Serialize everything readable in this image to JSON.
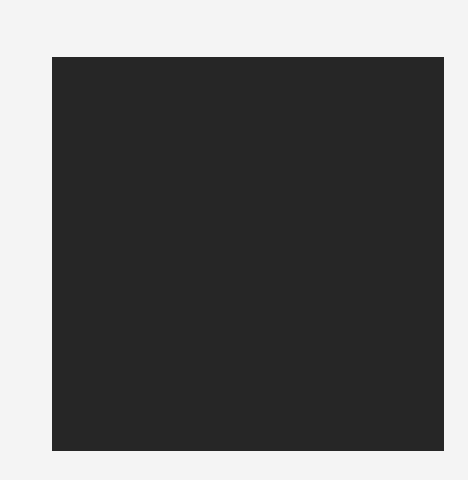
{
  "chart_data": {
    "type": "heatmap",
    "title": "",
    "xlabel": "",
    "ylabel": "",
    "colormap": "gray",
    "vmin": 0,
    "vmax": 16,
    "x_ticks": [
      "0",
      "1",
      "2",
      "3",
      "4",
      "5",
      "6",
      "7"
    ],
    "y_ticks": [
      "0",
      "1",
      "2",
      "3",
      "4",
      "5",
      "6",
      "7"
    ],
    "x_axis_position": "top",
    "grid": false,
    "values": [
      [
        0,
        0,
        0,
        0,
        9,
        0,
        0,
        0
      ],
      [
        0,
        0,
        0,
        7,
        7,
        0,
        0,
        0
      ],
      [
        0,
        0,
        0,
        11,
        6,
        3,
        3,
        0
      ],
      [
        0,
        0,
        7,
        13,
        1,
        8,
        8,
        0
      ],
      [
        0,
        5,
        16,
        8,
        1,
        16,
        5,
        0
      ],
      [
        0,
        5,
        14,
        16,
        11,
        16,
        0,
        0
      ],
      [
        0,
        0,
        0,
        4,
        14,
        9,
        0,
        0
      ],
      [
        0,
        0,
        0,
        4,
        15,
        5,
        0,
        0
      ]
    ]
  }
}
